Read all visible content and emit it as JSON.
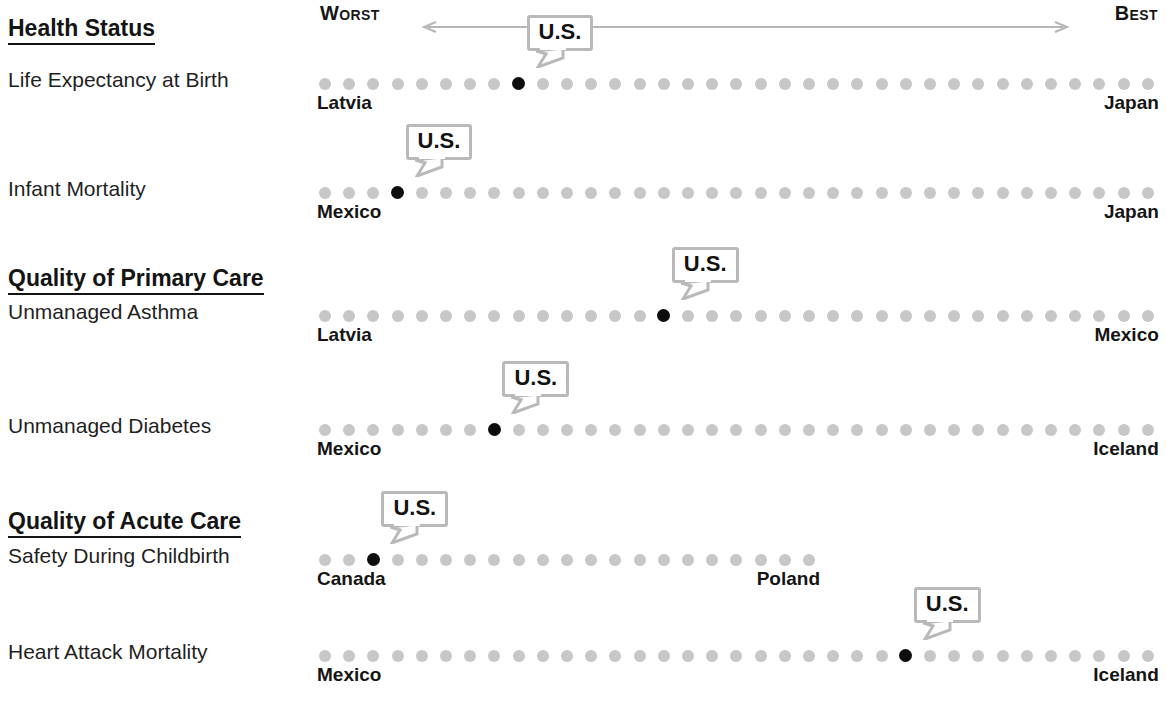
{
  "scale": {
    "worst_label": "Worst",
    "best_label": "Best",
    "arrow_icon": "double-headed-arrow-icon"
  },
  "us_marker_label": "U.S.",
  "colors": {
    "dot_inactive": "#c7c7c7",
    "dot_us": "#0d0d0d",
    "callout_border": "#b9b9b9",
    "text": "#1c1c1c"
  },
  "chart_data": {
    "type": "scatter",
    "xlabel": "Ranking from Worst to Best",
    "ylabel": "",
    "grid": false,
    "legend": "none",
    "axis_direction": "left = Worst, right = Best",
    "sections": [
      {
        "title": "Health Status",
        "rows": [
          {
            "label": "Life Expectancy at Birth",
            "dot_count": 35,
            "us_rank": 9,
            "worst_country": "Latvia",
            "best_country": "Japan",
            "us_label": "U.S."
          },
          {
            "label": "Infant Mortality",
            "dot_count": 35,
            "us_rank": 4,
            "worst_country": "Mexico",
            "best_country": "Japan",
            "us_label": "U.S."
          }
        ]
      },
      {
        "title": "Quality of Primary Care",
        "rows": [
          {
            "label": "Unmanaged Asthma",
            "dot_count": 35,
            "us_rank": 15,
            "worst_country": "Latvia",
            "best_country": "Mexico",
            "us_label": "U.S."
          },
          {
            "label": "Unmanaged Diabetes",
            "dot_count": 35,
            "us_rank": 8,
            "worst_country": "Mexico",
            "best_country": "Iceland",
            "us_label": "U.S."
          }
        ]
      },
      {
        "title": "Quality of Acute Care",
        "rows": [
          {
            "label": "Safety During Childbirth",
            "dot_count": 21,
            "us_rank": 3,
            "worst_country": "Canada",
            "best_country": "Poland",
            "us_label": "U.S."
          },
          {
            "label": "Heart Attack Mortality",
            "dot_count": 35,
            "us_rank": 25,
            "worst_country": "Mexico",
            "best_country": "Iceland",
            "us_label": "U.S."
          }
        ]
      }
    ]
  }
}
